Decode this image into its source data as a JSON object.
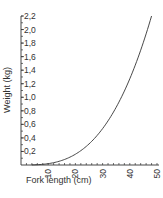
{
  "chart_data": {
    "type": "line",
    "title": "",
    "xlabel": "Fork length (cm)",
    "ylabel": "Weight (kg)",
    "xlim": [
      0,
      50
    ],
    "ylim": [
      0,
      2.2
    ],
    "x_ticks": [
      10,
      20,
      30,
      40,
      50
    ],
    "x_tick_labels": [
      "10",
      "20",
      "30",
      "40",
      "50"
    ],
    "y_ticks": [
      0.2,
      0.4,
      0.6,
      0.8,
      1.0,
      1.2,
      1.4,
      1.6,
      1.8,
      2.0,
      2.2
    ],
    "y_tick_labels": [
      "0,2",
      "0,4",
      "0,6",
      "0,8",
      "1,0",
      "1,2",
      "1,4",
      "1,6",
      "1,8",
      "2,0",
      "2,2"
    ],
    "grid": false,
    "legend": null,
    "series": [
      {
        "name": "Weight-length relationship",
        "x": [
          5,
          10,
          15,
          20,
          25,
          30,
          35,
          40,
          45,
          48
        ],
        "values": [
          0.0025,
          0.02,
          0.07,
          0.16,
          0.31,
          0.54,
          0.86,
          1.28,
          1.82,
          2.2
        ]
      }
    ]
  }
}
